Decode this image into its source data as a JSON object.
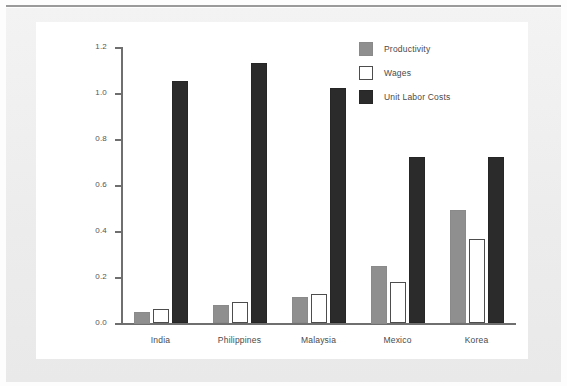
{
  "chart_data": {
    "type": "bar",
    "title": "",
    "subtitle": "",
    "xlabel": "",
    "ylabel": "",
    "categories": [
      "India",
      "Philippines",
      "Malaysia",
      "Mexico",
      "Korea"
    ],
    "series": [
      {
        "name": "Productivity",
        "color": "#8f8f8f",
        "values": [
          0.05,
          0.08,
          0.115,
          0.25,
          0.49
        ]
      },
      {
        "name": "Wages",
        "color": "#ffffff",
        "values": [
          0.06,
          0.09,
          0.125,
          0.18,
          0.365
        ]
      },
      {
        "name": "Unit Labor Costs",
        "color": "#2b2b2b",
        "values": [
          1.05,
          1.13,
          1.02,
          0.72,
          0.72
        ]
      }
    ],
    "ylim": [
      0.0,
      1.2
    ],
    "ytick_values": [
      0.0,
      0.2,
      0.4,
      0.6,
      0.8,
      1.0,
      1.2
    ],
    "ytick_labels": [
      "0.0",
      "0.2",
      "0.4",
      "0.6",
      "0.8",
      "1.0",
      "1.2"
    ],
    "grid": false,
    "legend_position": "top-right",
    "legend": [
      "Productivity",
      "Wages",
      "Unit Labor Costs"
    ]
  },
  "colors": {
    "productivity": "#8f8f8f",
    "wages": "#ffffff",
    "unit_labor_costs": "#2b2b2b",
    "axis": "#6f6f6f",
    "page": "#ffffff",
    "border_band": "#ececec"
  }
}
